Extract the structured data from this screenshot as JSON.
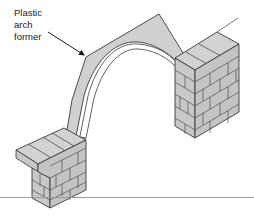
{
  "figure": {
    "label": {
      "lines": [
        "Plastic",
        "arch",
        "former"
      ]
    },
    "colors": {
      "brick_fill": "#c8c8c8",
      "brick_top": "#d2d2d2",
      "former_fill": "#d0d0d0",
      "stroke": "#3a3a3a",
      "rule": "#9a9a9a"
    }
  }
}
